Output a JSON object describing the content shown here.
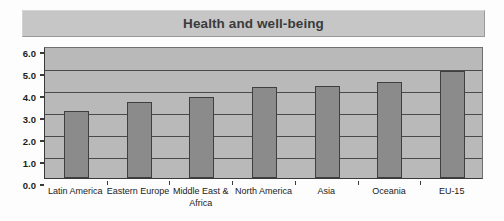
{
  "chart_data": {
    "type": "bar",
    "title": "Health and well-being",
    "xlabel": "",
    "ylabel": "",
    "ylim": [
      0.0,
      6.0
    ],
    "ytick_step": 1.0,
    "ytick_labels": [
      "6.0",
      "5.0",
      "4.0",
      "3.0",
      "2.0",
      "1.0",
      "0.0"
    ],
    "ytick_values": [
      6.0,
      5.0,
      4.0,
      3.0,
      2.0,
      1.0,
      0.0
    ],
    "grid": true,
    "grid_axis": "y",
    "legend": false,
    "categories": [
      "Latin America",
      "Eastern Europe",
      "Middle East & Africa",
      "North America",
      "Asia",
      "Oceania",
      "EU-15"
    ],
    "values": [
      3.05,
      3.45,
      3.7,
      4.15,
      4.2,
      4.35,
      4.85
    ],
    "colors": {
      "bar_fill": "#8b8b8b",
      "bar_border": "#3f3f3f",
      "plot_background": "#b9b9b9",
      "gridline": "#4a4a4a",
      "axis": "#3a3a3a",
      "title_band": "#c6c6c6",
      "title_text": "#3b3b3b",
      "page_background": "#fdfdfd"
    }
  }
}
